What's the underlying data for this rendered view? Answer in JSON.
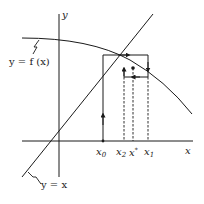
{
  "diagram": {
    "type": "fixed-point-iteration-cobweb",
    "axes": {
      "x_label": "x",
      "y_label": "y"
    },
    "curves": [
      {
        "name": "f",
        "label": "y = f (x)"
      },
      {
        "name": "identity",
        "label": "y = x"
      }
    ],
    "points": [
      {
        "id": "x0",
        "base": "x",
        "sub": "0"
      },
      {
        "id": "x2",
        "base": "x",
        "sub": "2"
      },
      {
        "id": "xstar",
        "base": "x",
        "sup": "*"
      },
      {
        "id": "x1",
        "base": "x",
        "sub": "1"
      }
    ],
    "colors": {
      "ink": "#1a1a1a",
      "background": "#ffffff"
    }
  }
}
